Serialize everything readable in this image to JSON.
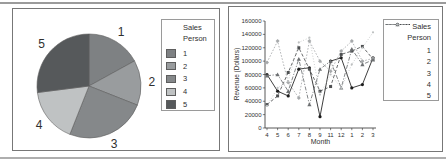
{
  "page": {
    "background": "#ffffff",
    "top_rule_color": "#9b9b9b",
    "bottom_rule_color": "#aeaeae",
    "panel_border_color": "#777777"
  },
  "chart_data": [
    {
      "type": "pie",
      "name": "sales-person-pie",
      "title": "",
      "legend_title": "Sales Person",
      "legend_title_lines": [
        "Sales",
        "Person"
      ],
      "categories": [
        "1",
        "2",
        "3",
        "4",
        "5"
      ],
      "values_percent": [
        17,
        14,
        25,
        17,
        27
      ],
      "colors": [
        "#7e8183",
        "#999c9e",
        "#85888a",
        "#bfc2c3",
        "#56595b"
      ],
      "start_angle_deg": 0,
      "direction": "clockwise",
      "slice_labels": [
        "1",
        "2",
        "3",
        "4",
        "5"
      ],
      "slice_label_color": "#2f2f2f"
    },
    {
      "type": "line",
      "name": "revenue-by-month-line",
      "title": "",
      "xlabel": "Month",
      "ylabel": "Revenue (Dollars)",
      "ylim": [
        0,
        160000
      ],
      "yticks": [
        0,
        20000,
        40000,
        60000,
        80000,
        100000,
        120000,
        140000,
        160000
      ],
      "categories": [
        "4",
        "5",
        "6",
        "7",
        "8",
        "9",
        "11",
        "12",
        "1",
        "2",
        "3"
      ],
      "grid": false,
      "axis_color": "#2f2f2f",
      "legend_title": "Sales Person",
      "legend_title_lines": [
        "Sales",
        "Person"
      ],
      "legend_position": "right",
      "series": [
        {
          "name": "1",
          "color": "#1c1c1c",
          "dash": "solid",
          "marker": "circle",
          "values": [
            80000,
            55000,
            48000,
            88000,
            90000,
            17000,
            100000,
            105000,
            60000,
            65000,
            105000
          ]
        },
        {
          "name": "2",
          "color": "#4e5052",
          "dash": "dashed",
          "marker": "square",
          "values": [
            35000,
            48000,
            83000,
            120000,
            88000,
            55000,
            62000,
            110000,
            115000,
            122000,
            103000
          ]
        },
        {
          "name": "3",
          "color": "#a6a9ab",
          "dash": "dotted",
          "marker": "diamond",
          "values": [
            98000,
            130000,
            68000,
            45000,
            130000,
            100000,
            85000,
            115000,
            130000,
            100000,
            104000
          ]
        },
        {
          "name": "4",
          "color": "#6d7072",
          "dash": "dash-dot",
          "marker": "triangle",
          "values": [
            78000,
            80000,
            55000,
            103000,
            35000,
            88000,
            100000,
            60000,
            118000,
            95000,
            102000
          ]
        },
        {
          "name": "5",
          "color": "#bdc0c1",
          "dash": "fine-dotted",
          "marker": "dot",
          "values": [
            33000,
            60000,
            70000,
            128000,
            135000,
            50000,
            80000,
            60000,
            95000,
            120000,
            143000
          ]
        }
      ]
    }
  ]
}
